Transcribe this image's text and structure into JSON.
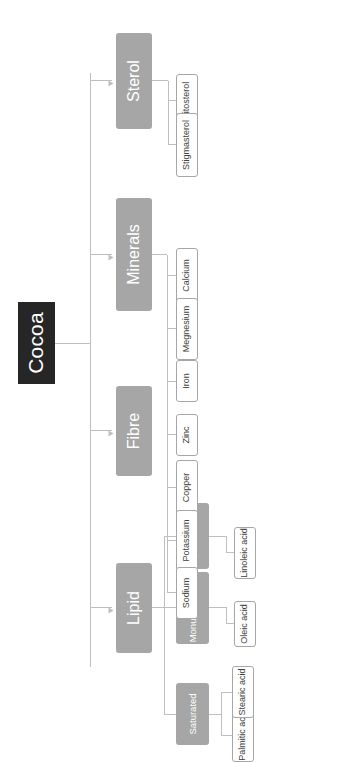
{
  "diagram": {
    "orientation": "rotated-90-ccw",
    "colors": {
      "root_fill": "#262626",
      "root_text": "#ffffff",
      "branch_fill": "#a6a6a6",
      "branch_text": "#ffffff",
      "leaf_fill": "#ffffff",
      "leaf_text": "#404040",
      "leaf_border": "#a6a6a6",
      "connector": "#bfbfbf",
      "background": "#ffffff"
    }
  },
  "root": {
    "label": "Cocoa"
  },
  "branches": [
    {
      "id": "lipid",
      "label": "Lipid",
      "subgroups": [
        {
          "id": "saturated",
          "label": "Saturated",
          "leaves": [
            {
              "label": "Palmitic acid"
            },
            {
              "label": "Stearic acid"
            }
          ]
        },
        {
          "id": "monunsaturated",
          "label": "Monunsaturated",
          "leaves": [
            {
              "label": "Oleic acid"
            }
          ]
        },
        {
          "id": "polyunsaturated",
          "label": "Polyunsaturated",
          "leaves": [
            {
              "label": "Linoleic acid"
            }
          ]
        }
      ]
    },
    {
      "id": "fibre",
      "label": "Fibre",
      "subgroups": [],
      "leaves": []
    },
    {
      "id": "minerals",
      "label": "Minerals",
      "leaves": [
        {
          "label": "Calcium"
        },
        {
          "label": "Megnesium"
        },
        {
          "label": "Iron"
        },
        {
          "label": "Zinc"
        },
        {
          "label": "Copper"
        },
        {
          "label": "Potassium"
        },
        {
          "label": "Sodium"
        }
      ]
    },
    {
      "id": "sterol",
      "label": "Sterol",
      "leaves": [
        {
          "label": "Sitosterol"
        },
        {
          "label": "Stigmasterol"
        }
      ]
    }
  ]
}
